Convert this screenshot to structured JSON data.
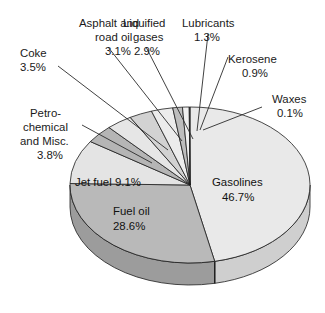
{
  "chart_data": {
    "type": "pie",
    "title": "",
    "subtitle": "",
    "xlabel": "",
    "ylabel": "",
    "legend_position": "none",
    "grid": false,
    "units": "percent",
    "three_d": true,
    "start_angle_deg": 0,
    "direction": "clockwise",
    "categories": [
      "Gasolines",
      "Fuel oil",
      "Jet fuel",
      "Petrochemical and Misc.",
      "Coke",
      "Asphalt and road oil",
      "Liquified gases",
      "Lubricants",
      "Kerosene",
      "Waxes"
    ],
    "values": [
      46.7,
      28.6,
      9.1,
      3.8,
      3.5,
      3.1,
      2.9,
      1.3,
      0.9,
      0.1
    ],
    "slices": [
      {
        "name": "Gasolines",
        "value": 46.7,
        "label": "Gasolines",
        "pct_text": "46.7%",
        "color": "#e9e9e9",
        "wall_color": "#cfcfcf",
        "label_placement": "inside"
      },
      {
        "name": "Fuel oil",
        "value": 28.6,
        "label": "Fuel oil",
        "pct_text": "28.6%",
        "color": "#b9b9b9",
        "wall_color": "#9c9c9c",
        "label_placement": "inside"
      },
      {
        "name": "Jet fuel",
        "value": 9.1,
        "label": "Jet fuel",
        "pct_text": "9.1%",
        "color": "#e4e4e4",
        "wall_color": "#c6c6c6",
        "label_placement": "inside"
      },
      {
        "name": "Petrochemical and Misc.",
        "value": 3.8,
        "label": "Petro-chemical and Misc.",
        "pct_text": "3.8%",
        "color": "#b5b5b5",
        "wall_color": "#9c9c9c",
        "label_placement": "leader"
      },
      {
        "name": "Coke",
        "value": 3.5,
        "label": "Coke",
        "pct_text": "3.5%",
        "color": "#e6e6e6",
        "wall_color": "#c6c6c6",
        "label_placement": "leader"
      },
      {
        "name": "Asphalt and road oil",
        "value": 3.1,
        "label": "Asphalt and road oil",
        "pct_text": "3.1%",
        "color": "#d2d2d2",
        "wall_color": "#b2b2b2",
        "label_placement": "leader"
      },
      {
        "name": "Liquified gases",
        "value": 2.9,
        "label": "Liquified gases",
        "pct_text": "2.9%",
        "color": "#ececec",
        "wall_color": "#cfcfcf",
        "label_placement": "leader"
      },
      {
        "name": "Lubricants",
        "value": 1.3,
        "label": "Lubricants",
        "pct_text": "1.3%",
        "color": "#bdbdbd",
        "wall_color": "#a2a2a2",
        "label_placement": "leader"
      },
      {
        "name": "Kerosene",
        "value": 0.9,
        "label": "Kerosene",
        "pct_text": "0.9%",
        "color": "#efefef",
        "wall_color": "#d2d2d2",
        "label_placement": "leader"
      },
      {
        "name": "Waxes",
        "value": 0.1,
        "label": "Waxes",
        "pct_text": "0.1%",
        "color": "#7a7a7a",
        "wall_color": "#6a6a6a",
        "label_placement": "leader"
      }
    ]
  },
  "labels": {
    "asphalt_l1": "Asphalt and",
    "asphalt_l2": "road oil",
    "asphalt_pct": "3.1%",
    "liquified_l1": "Liquified",
    "liquified_l2": "gases",
    "liquified_pct": "2.9%",
    "lubricants_l1": "Lubricants",
    "lubricants_pct": "1.3%",
    "kerosene_l1": "Kerosene",
    "kerosene_pct": "0.9%",
    "waxes_l1": "Waxes",
    "waxes_pct": "0.1%",
    "coke_l1": "Coke",
    "coke_pct": "3.5%",
    "petro_l1": "Petro-",
    "petro_l2": "chemical",
    "petro_l3": "and Misc.",
    "petro_pct": "3.8%",
    "jetfuel_inline": "Jet fuel 9.1%",
    "fueloil_l1": "Fuel oil",
    "fueloil_pct": "28.6%",
    "gasolines_l1": "Gasolines",
    "gasolines_pct": "46.7%"
  },
  "colors": {
    "background": "#ffffff",
    "outline": "#1d1d1d",
    "text": "#1a1a1a",
    "leader": "#2b2b2b"
  }
}
